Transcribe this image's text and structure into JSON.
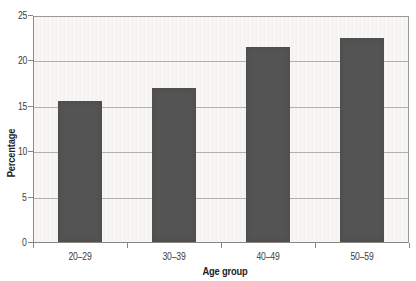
{
  "chart_data": {
    "type": "bar",
    "categories": [
      "20–29",
      "30–39",
      "40–49",
      "50–59"
    ],
    "values": [
      15.5,
      17,
      21.5,
      22.5
    ],
    "title": "",
    "xlabel": "Age group",
    "ylabel": "Percentage",
    "ylim": [
      0,
      25
    ],
    "yticks": [
      0,
      5,
      10,
      15,
      20,
      25
    ],
    "grid": "horizontal-only",
    "legend": "none",
    "bar_width_px": 44,
    "colors": {
      "bar": "#545454",
      "plot_background": "#f4f3f0",
      "gridline": "#b2b0ac",
      "axis": "#888682",
      "text": "#3c3c3c",
      "page_background": "#ffffff"
    }
  }
}
